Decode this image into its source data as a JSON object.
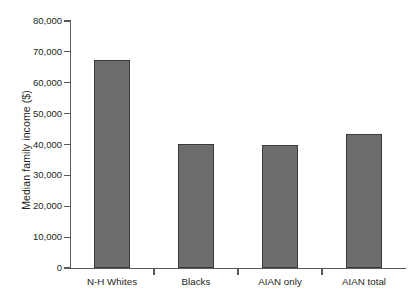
{
  "chart_data": {
    "type": "bar",
    "title": "",
    "subtitle": "",
    "xlabel": "",
    "ylabel": "Median family income ($)",
    "categories": [
      "N-H Whites",
      "Blacks",
      "AIAN only",
      "AIAN total"
    ],
    "values": [
      67500,
      40200,
      39800,
      43300
    ],
    "series": [
      {
        "name": "Median family income",
        "values": [
          67500,
          40200,
          39800,
          43300
        ]
      }
    ],
    "ylim": [
      0,
      80000
    ],
    "ytick_values": [
      0,
      10000,
      20000,
      30000,
      40000,
      50000,
      60000,
      70000,
      80000
    ],
    "ytick_labels": [
      "0",
      "10,000",
      "20,000",
      "30,000",
      "40,000",
      "50,000",
      "60,000",
      "70,000",
      "80,000"
    ],
    "grid": false,
    "legend": false,
    "legend_position": "none",
    "bar_color": "#6d6d6d",
    "bar_edge_color": "#3a3a3a",
    "axis_color": "#58595b",
    "text_color": "#231f20",
    "background_color": "#ffffff"
  }
}
